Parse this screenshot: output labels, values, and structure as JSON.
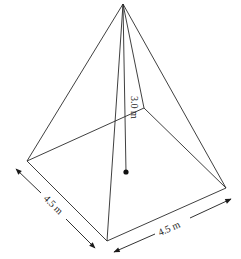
{
  "diagram": {
    "type": "square-pyramid",
    "labels": {
      "height": "3.0 m",
      "base_left_side": "4.5 m",
      "base_right_side": "4.5 m"
    },
    "vertices": {
      "apex": [
        123,
        4
      ],
      "left": [
        27,
        161
      ],
      "front": [
        107,
        241
      ],
      "right": [
        226,
        188
      ],
      "back": [
        144,
        108
      ]
    },
    "center_point": [
      126,
      172
    ],
    "colors": {
      "line": "#2a2a2a",
      "background": "#ffffff"
    }
  }
}
